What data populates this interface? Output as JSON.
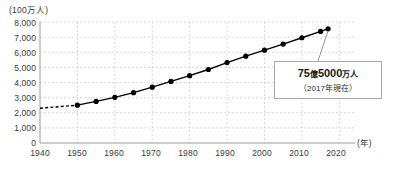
{
  "chart_data": {
    "type": "line",
    "title": "",
    "xlabel": "(年)",
    "ylabel": "(100万人)",
    "x": [
      1940,
      1950,
      1955,
      1960,
      1965,
      1970,
      1975,
      1980,
      1985,
      1990,
      1995,
      2000,
      2005,
      2010,
      2015,
      2017
    ],
    "values": [
      2300,
      2500,
      2750,
      3020,
      3330,
      3690,
      4070,
      4450,
      4860,
      5320,
      5740,
      6140,
      6540,
      6960,
      7380,
      7550
    ],
    "series": [
      {
        "name": "世界人口",
        "x": [
          1940,
          1950,
          1955,
          1960,
          1965,
          1970,
          1975,
          1980,
          1985,
          1990,
          1995,
          2000,
          2005,
          2010,
          2015,
          2017
        ],
        "values": [
          2300,
          2500,
          2750,
          3020,
          3330,
          3690,
          4070,
          4450,
          4860,
          5320,
          5740,
          6140,
          6540,
          6960,
          7380,
          7550
        ]
      }
    ],
    "dashed_segment": {
      "x": [
        1940,
        1950
      ],
      "values": [
        2300,
        2500
      ]
    },
    "marker_start_year": 1950,
    "xlim": [
      1940,
      2025
    ],
    "ylim": [
      0,
      8000
    ],
    "ytick_step": 1000,
    "xtick_step": 10,
    "grid": true,
    "legend": "none",
    "y_tick_labels": [
      "8,000",
      "7,000",
      "6,000",
      "5,000",
      "4,000",
      "3,000",
      "2,000",
      "1,000",
      "0"
    ],
    "y_tick_values": [
      8000,
      7000,
      6000,
      5000,
      4000,
      3000,
      2000,
      1000,
      0
    ],
    "x_tick_labels": [
      "1940",
      "1950",
      "1960",
      "1970",
      "1980",
      "1990",
      "2000",
      "2010",
      "2020"
    ],
    "x_tick_values": [
      1940,
      1950,
      1960,
      1970,
      1980,
      1990,
      2000,
      2010,
      2020
    ],
    "annotations": [
      {
        "name": "population-callout",
        "value_text": "75億5000万人",
        "value_number_1": "75",
        "value_kanji_1": "億",
        "value_number_2": "5000",
        "value_kanji_2": "万人",
        "sub_text": "（2017年現在）",
        "points_to_year": 2017,
        "points_to_value": 7550
      }
    ],
    "colors": {
      "line": "#000000",
      "marker": "#000000",
      "grid": "#c9c9c9",
      "axis": "#9a9a9a",
      "text": "#3a3a3a",
      "callout_border": "#a8a8a8",
      "callout_bg": "#ffffff",
      "leader": "#8a8a8a"
    }
  }
}
